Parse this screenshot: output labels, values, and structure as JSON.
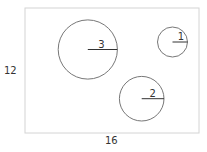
{
  "diagram": {
    "rectangle": {
      "x": 25,
      "y": 8,
      "width": 174,
      "height": 125,
      "stroke": "#d4d4d4",
      "width_label": "16",
      "height_label": "12"
    },
    "circles": [
      {
        "label": "1",
        "cx": 172.5,
        "cy": 42,
        "r": 15,
        "stroke": "#777777"
      },
      {
        "label": "2",
        "cx": 141.7,
        "cy": 98.7,
        "r": 22.3,
        "stroke": "#777777"
      },
      {
        "label": "3",
        "cx": 87.8,
        "cy": 49.5,
        "r": 29.6,
        "stroke": "#777777"
      }
    ]
  }
}
